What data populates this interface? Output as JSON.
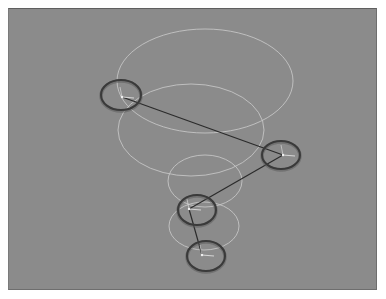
{
  "viewport": {
    "name": "3d-viewport",
    "background": "#8b8b8b"
  },
  "scene": {
    "description": "Bone chain / IK rig with swing-range ellipses",
    "guide_ellipses": [
      {
        "cx": 205,
        "cy": 81,
        "rx": 88,
        "ry": 52
      },
      {
        "cx": 191,
        "cy": 130,
        "rx": 73,
        "ry": 46
      },
      {
        "cx": 205,
        "cy": 181,
        "rx": 37,
        "ry": 26
      },
      {
        "cx": 204,
        "cy": 226,
        "rx": 35,
        "ry": 24
      }
    ],
    "joints": [
      {
        "id": "joint-1",
        "cx": 121,
        "cy": 95,
        "rx": 20,
        "ry": 15,
        "pivot": [
          122,
          97
        ]
      },
      {
        "id": "joint-2",
        "cx": 281,
        "cy": 155,
        "rx": 19,
        "ry": 14,
        "pivot": [
          283,
          155
        ]
      },
      {
        "id": "joint-3",
        "cx": 197,
        "cy": 210,
        "rx": 19,
        "ry": 15,
        "pivot": [
          189,
          209
        ]
      },
      {
        "id": "joint-4",
        "cx": 206,
        "cy": 256,
        "rx": 19,
        "ry": 15,
        "pivot": [
          202,
          255
        ]
      }
    ],
    "bones": [
      {
        "from": [
          122,
          97
        ],
        "to": [
          283,
          155
        ]
      },
      {
        "from": [
          283,
          155
        ],
        "to": [
          189,
          209
        ]
      },
      {
        "from": [
          189,
          209
        ],
        "to": [
          202,
          255
        ]
      }
    ],
    "colors": {
      "guide": "#c8c8c8",
      "joint": "#3a3a3a",
      "bone": "#2b2b2b",
      "axis": "#e8e8e8"
    }
  }
}
